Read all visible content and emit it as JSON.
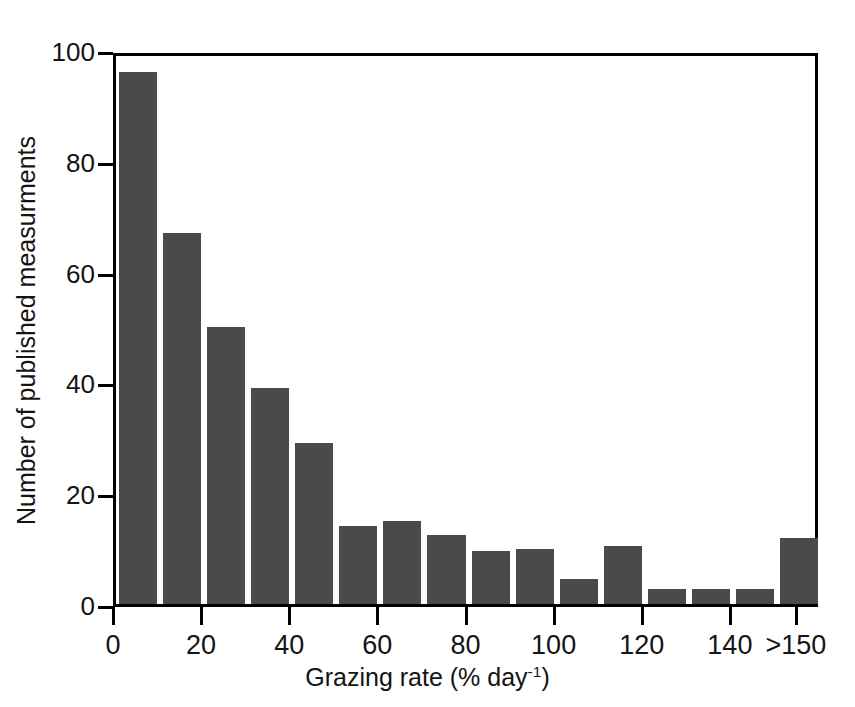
{
  "chart_data": {
    "type": "bar",
    "title": "",
    "subtitle": "",
    "xlabel_text": "Grazing rate (% day",
    "xlabel_sup": "-1",
    "xlabel_tail": ")",
    "xlabel_full": "Grazing rate (% day-1)",
    "ylabel": "Number of published measurments",
    "categories": [
      "0-10",
      "10-20",
      "20-30",
      "30-40",
      "40-50",
      "50-60",
      "60-70",
      "70-80",
      "80-90",
      "90-100",
      "100-110",
      "110-120",
      "120-130",
      "130-140",
      "140-150",
      ">150"
    ],
    "bin_starts": [
      0,
      10,
      20,
      30,
      40,
      50,
      60,
      70,
      80,
      90,
      100,
      110,
      120,
      130,
      140,
      150
    ],
    "values": [
      96,
      67,
      50,
      39,
      29,
      14,
      15,
      12.5,
      9.5,
      10,
      4.5,
      10.5,
      2.8,
      2.8,
      2.8,
      12
    ],
    "ylim": [
      0,
      100
    ],
    "xlim": [
      0,
      160
    ],
    "ytick_values": [
      0,
      20,
      40,
      60,
      80,
      100
    ],
    "yticks": [
      "0",
      "20",
      "40",
      "60",
      "80",
      "100"
    ],
    "xtick_values": [
      0,
      20,
      40,
      60,
      80,
      100,
      120,
      140,
      155
    ],
    "xticks": [
      "0",
      "20",
      "40",
      "60",
      "80",
      "100",
      "120",
      "140",
      ">150"
    ],
    "grid": false,
    "legend": false,
    "legend_position": "none",
    "bar_color": "#4a4a4a",
    "axis_color": "#000000",
    "background_color": "#ffffff",
    "bar_gap_px": 6
  }
}
